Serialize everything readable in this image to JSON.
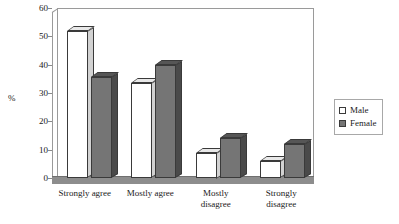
{
  "chart_data": {
    "type": "bar",
    "title": "",
    "xlabel": "",
    "ylabel": "%",
    "ylim": [
      0,
      60
    ],
    "yticks": [
      0,
      10,
      20,
      30,
      40,
      50,
      60
    ],
    "grid": false,
    "legend_position": "right",
    "categories": [
      "Strongly agree",
      "Mostly agree",
      "Mostly disagree",
      "Strongly disagree"
    ],
    "category_lines": [
      [
        "Strongly agree"
      ],
      [
        "Mostly agree"
      ],
      [
        "Mostly",
        "disagree"
      ],
      [
        "Strongly",
        "disagree"
      ]
    ],
    "series": [
      {
        "name": "Male",
        "values": [
          52,
          33.5,
          9,
          6
        ]
      },
      {
        "name": "Female",
        "values": [
          35.5,
          40,
          14,
          12
        ]
      }
    ],
    "colors": {
      "male": "#ffffff",
      "female": "#757575",
      "outline": "#3a3a3a",
      "floor": "#8d8d8d",
      "axis": "#9a9a9a"
    }
  },
  "legend": {
    "items": [
      {
        "label": "Male"
      },
      {
        "label": "Female"
      }
    ]
  },
  "axis": {
    "y_label": "%",
    "y_ticks": [
      "60",
      "50",
      "40",
      "30",
      "20",
      "10",
      "0"
    ]
  }
}
